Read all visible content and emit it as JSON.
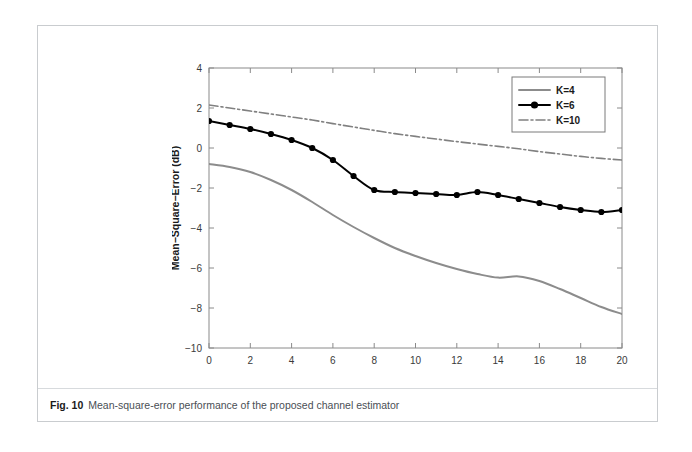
{
  "figure": {
    "caption_label": "Fig. 10",
    "caption_text": "Mean-square-error performance of the proposed channel estimator"
  },
  "chart_data": {
    "type": "line",
    "title": "",
    "xlabel": "SNR (dB)",
    "ylabel": "Mean−Square−Error (dB)",
    "xlim": [
      0,
      20
    ],
    "ylim": [
      -10,
      4
    ],
    "xticks": [
      0,
      2,
      4,
      6,
      8,
      10,
      12,
      14,
      16,
      18,
      20
    ],
    "yticks": [
      -10,
      -8,
      -6,
      -4,
      -2,
      0,
      2,
      4
    ],
    "xticklabels": [
      "0",
      "2",
      "4",
      "6",
      "8",
      "10",
      "12",
      "14",
      "16",
      "18",
      "20"
    ],
    "yticklabels": [
      "−10",
      "−8",
      "−6",
      "−4",
      "−2",
      "0",
      "2",
      "4"
    ],
    "grid": false,
    "legend_position": "upper right",
    "x": [
      0,
      1,
      2,
      3,
      4,
      5,
      6,
      7,
      8,
      9,
      10,
      11,
      12,
      13,
      14,
      15,
      16,
      17,
      18,
      19,
      20
    ],
    "series": [
      {
        "name": "K=4",
        "color": "#8c8c8c",
        "style": "solid",
        "marker": "none",
        "width": 2.0,
        "values": [
          -0.8,
          -0.95,
          -1.2,
          -1.6,
          -2.1,
          -2.7,
          -3.35,
          -3.95,
          -4.5,
          -5.0,
          -5.4,
          -5.75,
          -6.05,
          -6.3,
          -6.48,
          -6.42,
          -6.65,
          -7.05,
          -7.5,
          -7.95,
          -8.3
        ]
      },
      {
        "name": "K=6",
        "color": "#000000",
        "style": "solid",
        "marker": "circle",
        "width": 2.0,
        "values": [
          1.35,
          1.15,
          0.95,
          0.7,
          0.4,
          0.0,
          -0.6,
          -1.4,
          -2.1,
          -2.2,
          -2.25,
          -2.3,
          -2.35,
          -2.2,
          -2.35,
          -2.55,
          -2.75,
          -2.95,
          -3.1,
          -3.2,
          -3.1
        ]
      },
      {
        "name": "K=10",
        "color": "#808080",
        "style": "dashdot",
        "marker": "none",
        "width": 1.6,
        "values": [
          2.15,
          2.0,
          1.85,
          1.7,
          1.55,
          1.4,
          1.22,
          1.05,
          0.88,
          0.72,
          0.58,
          0.45,
          0.32,
          0.2,
          0.08,
          -0.04,
          -0.18,
          -0.3,
          -0.42,
          -0.52,
          -0.6
        ]
      }
    ]
  }
}
